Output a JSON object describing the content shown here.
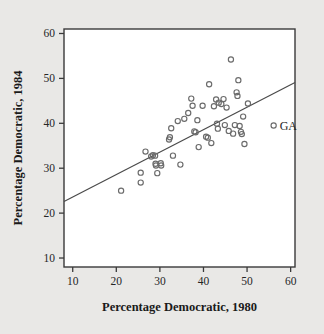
{
  "chart_data": {
    "type": "scatter",
    "title": "",
    "xlabel": "Percentage Democratic, 1980",
    "ylabel": "Percentage Democratic, 1984",
    "xlim": [
      8,
      61
    ],
    "ylim": [
      8,
      61
    ],
    "xticks": [
      10,
      20,
      30,
      40,
      50,
      60
    ],
    "yticks": [
      10,
      20,
      30,
      40,
      50,
      60
    ],
    "xtick_labels": [
      "10",
      "20",
      "30",
      "40",
      "50",
      "60"
    ],
    "ytick_labels": [
      "10",
      "20",
      "30",
      "40",
      "50",
      "60"
    ],
    "grid": false,
    "legend": "none",
    "marker": "open-circle",
    "marker_color": "#6b6b6b",
    "background_color": "#e9e8e6",
    "plot_background_color": "#ffffff",
    "axis_color": "#3a3a3a",
    "points": [
      {
        "x": 21.1,
        "y": 25.0
      },
      {
        "x": 25.6,
        "y": 26.8
      },
      {
        "x": 25.6,
        "y": 29.0
      },
      {
        "x": 26.7,
        "y": 33.7
      },
      {
        "x": 28.0,
        "y": 32.6
      },
      {
        "x": 28.4,
        "y": 32.9
      },
      {
        "x": 28.9,
        "y": 32.8
      },
      {
        "x": 29.0,
        "y": 31.0
      },
      {
        "x": 29.1,
        "y": 30.6
      },
      {
        "x": 29.4,
        "y": 28.9
      },
      {
        "x": 30.2,
        "y": 31.1
      },
      {
        "x": 30.3,
        "y": 30.6
      },
      {
        "x": 32.1,
        "y": 36.4
      },
      {
        "x": 32.3,
        "y": 36.9
      },
      {
        "x": 32.6,
        "y": 38.9
      },
      {
        "x": 33.0,
        "y": 32.8
      },
      {
        "x": 34.1,
        "y": 40.5
      },
      {
        "x": 34.7,
        "y": 30.8
      },
      {
        "x": 35.6,
        "y": 41.0
      },
      {
        "x": 36.5,
        "y": 42.3
      },
      {
        "x": 37.2,
        "y": 45.5
      },
      {
        "x": 37.5,
        "y": 43.9
      },
      {
        "x": 37.9,
        "y": 38.2
      },
      {
        "x": 38.2,
        "y": 38.0
      },
      {
        "x": 38.6,
        "y": 40.7
      },
      {
        "x": 38.9,
        "y": 34.7
      },
      {
        "x": 39.8,
        "y": 43.9
      },
      {
        "x": 40.6,
        "y": 37.0
      },
      {
        "x": 41.0,
        "y": 36.8
      },
      {
        "x": 41.3,
        "y": 48.7
      },
      {
        "x": 41.8,
        "y": 35.6
      },
      {
        "x": 42.4,
        "y": 43.8
      },
      {
        "x": 42.9,
        "y": 45.3
      },
      {
        "x": 43.1,
        "y": 39.9
      },
      {
        "x": 43.3,
        "y": 38.8
      },
      {
        "x": 43.5,
        "y": 44.6
      },
      {
        "x": 44.1,
        "y": 44.3
      },
      {
        "x": 44.6,
        "y": 45.4
      },
      {
        "x": 44.9,
        "y": 39.6
      },
      {
        "x": 45.3,
        "y": 43.5
      },
      {
        "x": 45.8,
        "y": 38.3
      },
      {
        "x": 46.3,
        "y": 54.2
      },
      {
        "x": 46.8,
        "y": 37.7
      },
      {
        "x": 47.2,
        "y": 39.6
      },
      {
        "x": 47.6,
        "y": 46.9
      },
      {
        "x": 47.8,
        "y": 46.1
      },
      {
        "x": 48.0,
        "y": 49.6
      },
      {
        "x": 48.3,
        "y": 39.4
      },
      {
        "x": 48.6,
        "y": 38.1
      },
      {
        "x": 48.8,
        "y": 37.6
      },
      {
        "x": 49.1,
        "y": 41.5
      },
      {
        "x": 49.4,
        "y": 35.4
      },
      {
        "x": 50.2,
        "y": 44.4
      },
      {
        "x": 56.1,
        "y": 39.5
      }
    ],
    "annotations": [
      {
        "label": "GA",
        "x": 56.1,
        "y": 39.5
      }
    ],
    "fit_line": {
      "x0": 8.0,
      "y0": 22.6,
      "x1": 61.0,
      "y1": 49.1
    }
  }
}
